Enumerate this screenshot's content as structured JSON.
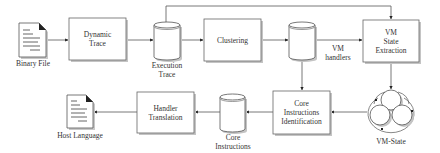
{
  "diagram": {
    "type": "flowchart",
    "colors": {
      "stroke": "#555555",
      "fill": "#ffffff",
      "shadow": "#bdbdbd",
      "text": "#333333"
    },
    "nodes": {
      "binary_file": {
        "label": "Binary File",
        "shape": "document"
      },
      "dynamic_trace": {
        "label_line1": "Dynamic",
        "label_line2": "Trace",
        "shape": "process"
      },
      "execution_trace": {
        "label_line1": "Execution",
        "label_line2": "Trace",
        "shape": "database"
      },
      "clustering": {
        "label": "Clustering",
        "shape": "process"
      },
      "vm_handlers": {
        "label_line1": "VM",
        "label_line2": "handlers",
        "shape": "database"
      },
      "vm_state_extraction": {
        "label_line1": "VM",
        "label_line2": "State",
        "label_line3": "Extraction",
        "shape": "process"
      },
      "vm_state": {
        "label": "VM-State",
        "shape": "state-cycle"
      },
      "core_instructions_identification": {
        "label_line1": "Core",
        "label_line2": "Instructions",
        "label_line3": "Identification",
        "shape": "process"
      },
      "core_instructions": {
        "label_line1": "Core",
        "label_line2": "Instructions",
        "shape": "database"
      },
      "handler_translation": {
        "label_line1": "Handler",
        "label_line2": "Translation",
        "shape": "process"
      },
      "host_language": {
        "label": "Host Language",
        "shape": "document"
      }
    },
    "edges": [
      {
        "from": "Binary File",
        "to": "Dynamic Trace"
      },
      {
        "from": "Dynamic Trace",
        "to": "Execution Trace"
      },
      {
        "from": "Execution Trace",
        "to": "Clustering"
      },
      {
        "from": "Execution Trace",
        "to": "VM State Extraction"
      },
      {
        "from": "Clustering",
        "to": "VM handlers"
      },
      {
        "from": "VM handlers",
        "to": "VM State Extraction"
      },
      {
        "from": "VM handlers",
        "to": "Core Instructions Identification"
      },
      {
        "from": "VM State Extraction",
        "to": "VM-State"
      },
      {
        "from": "VM-State",
        "to": "Core Instructions Identification"
      },
      {
        "from": "Core Instructions Identification",
        "to": "Core Instructions"
      },
      {
        "from": "Core Instructions",
        "to": "Handler Translation"
      },
      {
        "from": "Handler Translation",
        "to": "Host Language"
      }
    ]
  }
}
